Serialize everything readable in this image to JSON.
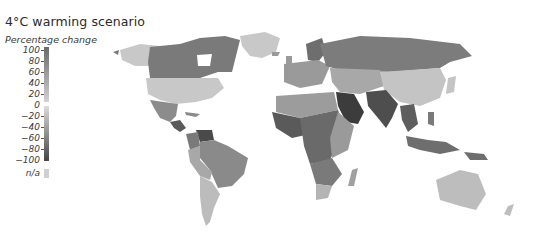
{
  "title": "4°C warming scenario",
  "legend": {
    "title": "Percentage change",
    "ticks": [
      "100",
      "80",
      "60",
      "40",
      "20",
      "0",
      "−20",
      "−40",
      "−60",
      "−80",
      "−100"
    ],
    "na_label": "n/a",
    "colors": {
      "high_positive": "#6a6a6a",
      "low_positive": "#d2d2d2",
      "low_negative": "#dcdcdc",
      "high_negative": "#444444",
      "na": "#cfcfcf"
    }
  },
  "map": {
    "type": "choropleth world map (grayscale)",
    "regions": [
      {
        "name": "Canada",
        "shade": "#7a7a7a"
      },
      {
        "name": "United States",
        "shade": "#c8c8c8"
      },
      {
        "name": "Greenland",
        "shade": "#c8c8c8"
      },
      {
        "name": "Mexico",
        "shade": "#8c8c8c"
      },
      {
        "name": "Central America",
        "shade": "#5a5a5a"
      },
      {
        "name": "Venezuela",
        "shade": "#4a4a4a"
      },
      {
        "name": "Brazil",
        "shade": "#8a8a8a"
      },
      {
        "name": "Peru/Bolivia",
        "shade": "#a8a8a8"
      },
      {
        "name": "Argentina/Chile",
        "shade": "#bcbcbc"
      },
      {
        "name": "Russia",
        "shade": "#7c7c7c"
      },
      {
        "name": "Europe",
        "shade": "#9a9a9a"
      },
      {
        "name": "Scandinavia",
        "shade": "#6e6e6e"
      },
      {
        "name": "China",
        "shade": "#c4c4c4"
      },
      {
        "name": "Central Asia",
        "shade": "#a8a8a8"
      },
      {
        "name": "Arabian Peninsula",
        "shade": "#3c3c3c"
      },
      {
        "name": "India/Pakistan",
        "shade": "#4e4e4e"
      },
      {
        "name": "North Africa",
        "shade": "#9c9c9c"
      },
      {
        "name": "West/Central Africa",
        "shade": "#6a6a6a"
      },
      {
        "name": "East Africa",
        "shade": "#9a9a9a"
      },
      {
        "name": "Southern Africa",
        "shade": "#7a7a7a"
      },
      {
        "name": "South Africa",
        "shade": "#b4b4b4"
      },
      {
        "name": "Madagascar",
        "shade": "#a0a0a0"
      },
      {
        "name": "Southeast Asia",
        "shade": "#5e5e5e"
      },
      {
        "name": "Indonesia",
        "shade": "#6e6e6e"
      },
      {
        "name": "Australia",
        "shade": "#bdbdbd"
      }
    ]
  }
}
